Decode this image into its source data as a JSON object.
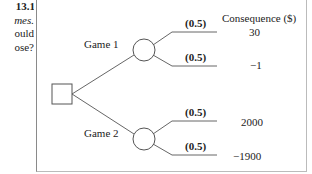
{
  "side_text": {
    "line1": "13.1",
    "line2": "mes.",
    "line3": "ould",
    "line4": "ose?"
  },
  "diagram": {
    "header": "Consequence ($)",
    "decision_node": "square",
    "branches": [
      {
        "label": "Game 1",
        "outcomes": [
          {
            "probability": "(0.5)",
            "consequence": "30"
          },
          {
            "probability": "(0.5)",
            "consequence": "−1"
          }
        ]
      },
      {
        "label": "Game 2",
        "outcomes": [
          {
            "probability": "(0.5)",
            "consequence": "2000"
          },
          {
            "probability": "(0.5)",
            "consequence": "−1900"
          }
        ]
      }
    ]
  }
}
